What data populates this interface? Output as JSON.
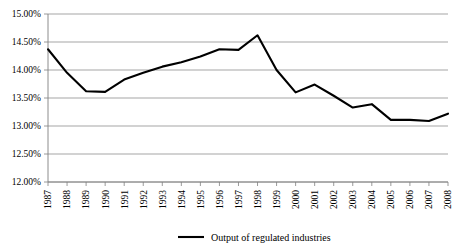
{
  "chart_data": {
    "type": "line",
    "title": "",
    "xlabel": "",
    "ylabel": "",
    "grid": true,
    "legend_position": "bottom-center",
    "categories": [
      "1987",
      "1988",
      "1989",
      "1990",
      "1991",
      "1992",
      "1993",
      "1994",
      "1995",
      "1996",
      "1997",
      "1998",
      "1999",
      "2000",
      "2001",
      "2002",
      "2003",
      "2004",
      "2005",
      "2006",
      "2007",
      "2008"
    ],
    "ylim": [
      12.0,
      15.0
    ],
    "ytick_values": [
      15.0,
      14.5,
      14.0,
      13.5,
      13.0,
      12.5,
      12.0
    ],
    "ytick_labels": [
      "15.00%",
      "14.50%",
      "14.00%",
      "13.50%",
      "13.00%",
      "12.50%",
      "12.00%"
    ],
    "series": [
      {
        "name": "Output of regulated industries",
        "color": "#000000",
        "values": [
          14.37,
          13.95,
          13.62,
          13.61,
          13.83,
          13.95,
          14.06,
          14.14,
          14.24,
          14.37,
          14.36,
          14.62,
          14.0,
          13.6,
          13.74,
          13.54,
          13.33,
          13.39,
          13.11,
          13.11,
          13.09,
          13.22
        ]
      }
    ]
  },
  "legend": {
    "entries": [
      {
        "label": "Output of regulated industries",
        "color": "#000000"
      }
    ]
  }
}
